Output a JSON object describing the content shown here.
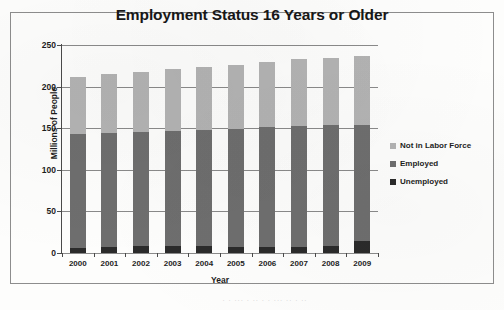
{
  "chart_data": {
    "type": "bar",
    "subtype": "stacked-bar",
    "title": "Employment Status 16 Years or Older",
    "xlabel": "Year",
    "ylabel": "Millions of People",
    "categories": [
      "2000",
      "2001",
      "2002",
      "2003",
      "2004",
      "2005",
      "2006",
      "2007",
      "2008",
      "2009"
    ],
    "ylim": [
      0,
      250
    ],
    "ytick_step": 50,
    "yticks": [
      0,
      50,
      100,
      150,
      200,
      250
    ],
    "ytick_labels": [
      "0",
      "50",
      "100",
      "150",
      "200",
      "250"
    ],
    "grid": true,
    "grid_axis": "y",
    "legend_position": "right",
    "series": [
      {
        "name": "Unemployed",
        "color": "#2b2b2b",
        "values": [
          5.7,
          6.8,
          8.4,
          8.8,
          8.1,
          7.6,
          7.0,
          7.1,
          8.9,
          14.3
        ]
      },
      {
        "name": "Employed",
        "color": "#6e6e6e",
        "values": [
          136.9,
          136.9,
          136.5,
          137.7,
          139.3,
          141.7,
          144.4,
          146.0,
          145.4,
          139.9
        ]
      },
      {
        "name": "Not in Labor Force",
        "color": "#b3b3b3",
        "values": [
          69.4,
          71.3,
          72.1,
          74.5,
          76.6,
          76.7,
          78.6,
          79.9,
          80.7,
          82.8
        ]
      }
    ],
    "totals": [
      212.0,
      215.0,
      217.0,
      221.0,
      224.0,
      226.0,
      230.0,
      233.0,
      235.0,
      237.0
    ]
  },
  "legend": {
    "items": [
      {
        "label": "Not in Labor Force",
        "color": "#b3b3b3"
      },
      {
        "label": "Employed",
        "color": "#6e6e6e"
      },
      {
        "label": "Unemployed",
        "color": "#2b2b2b"
      }
    ]
  },
  "caption": {
    "bleedthrough_text": "· · ··· · ·· · · ··· ·· · ··"
  }
}
